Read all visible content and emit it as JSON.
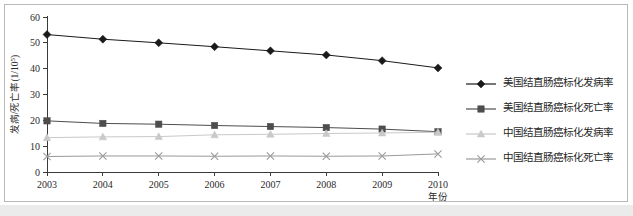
{
  "chart_data": {
    "type": "line",
    "title": "",
    "subtitle": "",
    "xlabel": "年份",
    "ylabel": "发病/死亡率(1/10",
    "ylabel_sup": "5",
    "ylabel_tail": ")",
    "categories": [
      "2003",
      "2004",
      "2005",
      "2006",
      "2007",
      "2008",
      "2009",
      "2010"
    ],
    "x": [
      2003,
      2004,
      2005,
      2006,
      2007,
      2008,
      2009,
      2010
    ],
    "xlim": [
      2003,
      2010
    ],
    "ylim": [
      0,
      60
    ],
    "yticks": [
      0,
      10,
      20,
      30,
      40,
      50,
      60
    ],
    "ytick_labels": [
      "0",
      "10",
      "20",
      "30",
      "40",
      "50",
      "60"
    ],
    "grid": false,
    "legend_position": "right",
    "series": [
      {
        "name": "美国结直肠癌标化发病率",
        "marker": "diamond",
        "color": "#1a1a1a",
        "line_color": "#1a1a1a",
        "values": [
          53.2,
          51.4,
          50.0,
          48.5,
          46.9,
          45.3,
          43.1,
          40.3
        ]
      },
      {
        "name": "美国结直肠癌标化死亡率",
        "marker": "square",
        "color": "#4d4d4d",
        "line_color": "#4d4d4d",
        "values": [
          19.8,
          18.8,
          18.5,
          18.0,
          17.6,
          17.2,
          16.6,
          15.6
        ]
      },
      {
        "name": "中国结直肠癌标化发病率",
        "marker": "triangle",
        "color": "#c9c9c9",
        "line_color": "#c9c9c9",
        "values": [
          13.3,
          13.6,
          13.7,
          14.4,
          14.6,
          14.9,
          15.1,
          15.4
        ]
      },
      {
        "name": "中国结直肠癌标化死亡率",
        "marker": "cross",
        "color": "#9a9a9a",
        "line_color": "#9a9a9a",
        "values": [
          6.0,
          6.2,
          6.2,
          6.1,
          6.2,
          6.1,
          6.2,
          7.0
        ]
      }
    ]
  },
  "legend": {
    "items": [
      {
        "label": "美国结直肠癌标化发病率",
        "marker": "diamond-marker",
        "color": "#1a1a1a"
      },
      {
        "label": "美国结直肠癌标化死亡率",
        "marker": "square-marker",
        "color": "#4d4d4d"
      },
      {
        "label": "中国结直肠癌标化发病率",
        "marker": "triangle-marker",
        "color": "#c9c9c9"
      },
      {
        "label": "中国结直肠癌标化死亡率",
        "marker": "cross-marker",
        "color": "#9a9a9a"
      }
    ]
  },
  "colors": {
    "background": "#ffffff",
    "border": "#b9b9b9",
    "axis": "#3a3a3a",
    "strip": "#ebebeb"
  }
}
